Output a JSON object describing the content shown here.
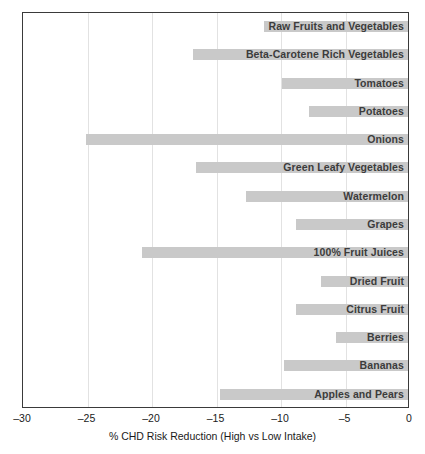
{
  "chart_data": {
    "type": "bar",
    "orientation": "horizontal",
    "title": "",
    "xlabel": "% CHD Risk Reduction (High vs Low Intake)",
    "ylabel": "",
    "xlim": [
      -30,
      0
    ],
    "xticks": [
      -30,
      -25,
      -20,
      -15,
      -10,
      -5,
      0
    ],
    "xticklabels": [
      "–30",
      "–25",
      "–20",
      "–15",
      "–10",
      "–5",
      "0"
    ],
    "grid": true,
    "legend": false,
    "bar_color": "#c9c9c9",
    "categories": [
      "Raw Fruits and Vegetables",
      "Beta-Carotene Rich Vegetables",
      "Tomatoes",
      "Potatoes",
      "Onions",
      "Green Leafy Vegetables",
      "Watermelon",
      "Grapes",
      "100% Fruit Juices",
      "Dried Fruit",
      "Citrus Fruit",
      "Berries",
      "Bananas",
      "Apples and Pears"
    ],
    "values": [
      -11.3,
      -16.8,
      -9.9,
      -7.8,
      -25.1,
      -16.6,
      -12.7,
      -8.8,
      -20.8,
      -6.9,
      -8.8,
      -5.7,
      -9.8,
      -14.7
    ]
  }
}
